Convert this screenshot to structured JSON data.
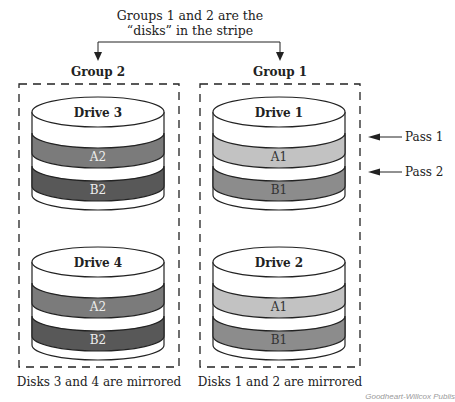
{
  "title": {
    "line1": "Groups 1 and 2 are the",
    "line2": "“disks” in the stripe"
  },
  "groups": [
    {
      "label": "Group 2",
      "caption": "Disks 3 and 4 are mirrored",
      "drives": [
        {
          "label": "Drive 3",
          "bands": [
            {
              "label": "A2",
              "color": "#7b7b7b"
            },
            {
              "label": "B2",
              "color": "#585858"
            }
          ]
        },
        {
          "label": "Drive 4",
          "bands": [
            {
              "label": "A2",
              "color": "#7b7b7b"
            },
            {
              "label": "B2",
              "color": "#585858"
            }
          ]
        }
      ]
    },
    {
      "label": "Group 1",
      "caption": "Disks 1 and 2 are mirrored",
      "drives": [
        {
          "label": "Drive 1",
          "bands": [
            {
              "label": "A1",
              "color": "#c2c2c2"
            },
            {
              "label": "B1",
              "color": "#8c8c8c"
            }
          ]
        },
        {
          "label": "Drive 2",
          "bands": [
            {
              "label": "A1",
              "color": "#c2c2c2"
            },
            {
              "label": "B1",
              "color": "#8c8c8c"
            }
          ]
        }
      ]
    }
  ],
  "passes": [
    {
      "label": "Pass 1"
    },
    {
      "label": "Pass 2"
    }
  ],
  "credit": "Goodheart-Willcox Publis",
  "colors": {
    "line": "#222222",
    "band_text_dark": "#eeeeee",
    "band_text_light": "#333333"
  }
}
